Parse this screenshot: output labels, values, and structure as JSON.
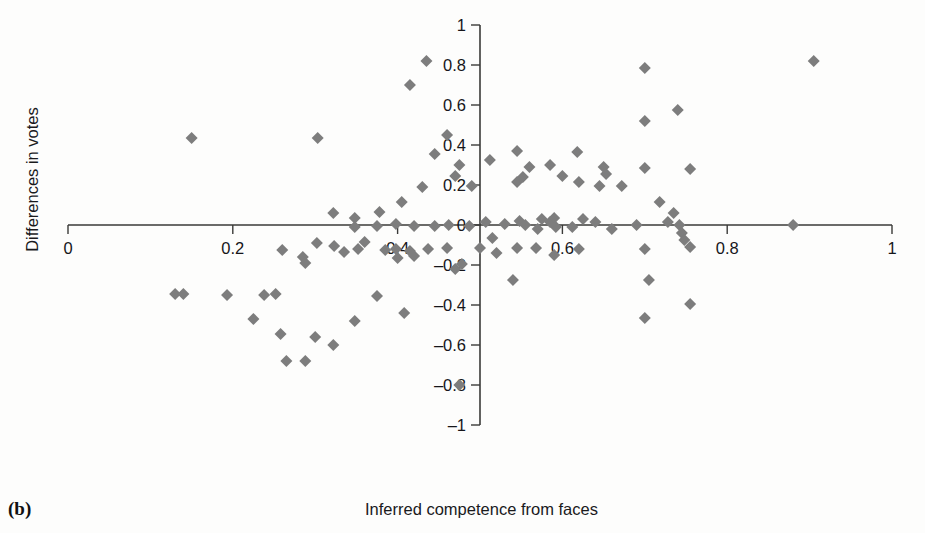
{
  "figure": {
    "panel_label": "(b)",
    "xlabel": "Inferred competence from faces",
    "ylabel": "Differences in votes"
  },
  "chart_data": {
    "type": "scatter",
    "title": "",
    "xlabel": "Inferred competence from faces",
    "ylabel": "Differences in votes",
    "xlim": [
      0,
      1
    ],
    "ylim": [
      -1,
      1
    ],
    "xticks": [
      0,
      0.2,
      0.4,
      0.6,
      0.8,
      1
    ],
    "xtick_labels": [
      "0",
      "0.2",
      "0.4",
      "0.6",
      "0.8",
      "1"
    ],
    "yticks": [
      -1,
      -0.8,
      -0.6,
      -0.4,
      -0.2,
      0,
      0.2,
      0.4,
      0.6,
      0.8,
      1
    ],
    "ytick_labels": [
      "-1",
      "-0.8",
      "-0.6",
      "-0.4",
      "-0.2",
      "0",
      "0.2",
      "0.4",
      "0.6",
      "0.8",
      "1"
    ],
    "grid": false,
    "legend": null,
    "marker": "diamond",
    "marker_color": "#7d7d7d",
    "marker_size": 11,
    "n_points": 106,
    "points": [
      [
        0.15,
        0.435
      ],
      [
        0.303,
        0.435
      ],
      [
        0.435,
        0.82
      ],
      [
        0.415,
        0.7
      ],
      [
        0.445,
        0.355
      ],
      [
        0.46,
        0.45
      ],
      [
        0.475,
        0.3
      ],
      [
        0.47,
        0.245
      ],
      [
        0.49,
        0.195
      ],
      [
        0.43,
        0.19
      ],
      [
        0.405,
        0.115
      ],
      [
        0.378,
        0.065
      ],
      [
        0.348,
        0.035
      ],
      [
        0.322,
        0.06
      ],
      [
        0.348,
        -0.01
      ],
      [
        0.375,
        -0.005
      ],
      [
        0.398,
        0.005
      ],
      [
        0.42,
        -0.005
      ],
      [
        0.512,
        0.325
      ],
      [
        0.545,
        0.37
      ],
      [
        0.56,
        0.29
      ],
      [
        0.552,
        0.24
      ],
      [
        0.545,
        0.215
      ],
      [
        0.585,
        0.3
      ],
      [
        0.6,
        0.245
      ],
      [
        0.618,
        0.365
      ],
      [
        0.62,
        0.215
      ],
      [
        0.65,
        0.29
      ],
      [
        0.653,
        0.255
      ],
      [
        0.645,
        0.195
      ],
      [
        0.672,
        0.195
      ],
      [
        0.7,
        0.285
      ],
      [
        0.7,
        0.52
      ],
      [
        0.7,
        0.785
      ],
      [
        0.74,
        0.575
      ],
      [
        0.755,
        0.28
      ],
      [
        0.905,
        0.82
      ],
      [
        0.507,
        0.015
      ],
      [
        0.515,
        -0.065
      ],
      [
        0.5,
        -0.115
      ],
      [
        0.53,
        0.005
      ],
      [
        0.548,
        0.02
      ],
      [
        0.555,
        0.0
      ],
      [
        0.57,
        -0.02
      ],
      [
        0.575,
        0.03
      ],
      [
        0.585,
        0.015
      ],
      [
        0.59,
        0.035
      ],
      [
        0.592,
        -0.01
      ],
      [
        0.612,
        -0.01
      ],
      [
        0.625,
        0.03
      ],
      [
        0.64,
        0.015
      ],
      [
        0.66,
        -0.02
      ],
      [
        0.69,
        0.0
      ],
      [
        0.718,
        0.115
      ],
      [
        0.728,
        0.015
      ],
      [
        0.735,
        0.06
      ],
      [
        0.742,
        0.0
      ],
      [
        0.745,
        -0.04
      ],
      [
        0.748,
        -0.075
      ],
      [
        0.755,
        -0.11
      ],
      [
        0.88,
        0.0
      ],
      [
        0.487,
        -0.005
      ],
      [
        0.462,
        0.0
      ],
      [
        0.445,
        -0.005
      ],
      [
        0.52,
        -0.14
      ],
      [
        0.545,
        -0.115
      ],
      [
        0.568,
        -0.115
      ],
      [
        0.59,
        -0.15
      ],
      [
        0.62,
        -0.12
      ],
      [
        0.7,
        -0.12
      ],
      [
        0.705,
        -0.275
      ],
      [
        0.54,
        -0.275
      ],
      [
        0.7,
        -0.465
      ],
      [
        0.755,
        -0.395
      ],
      [
        0.437,
        -0.12
      ],
      [
        0.46,
        -0.115
      ],
      [
        0.47,
        -0.22
      ],
      [
        0.478,
        -0.195
      ],
      [
        0.415,
        -0.13
      ],
      [
        0.42,
        -0.155
      ],
      [
        0.4,
        -0.165
      ],
      [
        0.398,
        -0.12
      ],
      [
        0.385,
        -0.125
      ],
      [
        0.36,
        -0.085
      ],
      [
        0.352,
        -0.12
      ],
      [
        0.335,
        -0.135
      ],
      [
        0.323,
        -0.105
      ],
      [
        0.302,
        -0.09
      ],
      [
        0.285,
        -0.16
      ],
      [
        0.288,
        -0.19
      ],
      [
        0.26,
        -0.125
      ],
      [
        0.252,
        -0.345
      ],
      [
        0.238,
        -0.35
      ],
      [
        0.193,
        -0.35
      ],
      [
        0.13,
        -0.345
      ],
      [
        0.14,
        -0.345
      ],
      [
        0.225,
        -0.47
      ],
      [
        0.258,
        -0.545
      ],
      [
        0.3,
        -0.56
      ],
      [
        0.265,
        -0.68
      ],
      [
        0.288,
        -0.68
      ],
      [
        0.322,
        -0.6
      ],
      [
        0.348,
        -0.48
      ],
      [
        0.375,
        -0.355
      ],
      [
        0.408,
        -0.44
      ],
      [
        0.475,
        -0.8
      ]
    ]
  }
}
